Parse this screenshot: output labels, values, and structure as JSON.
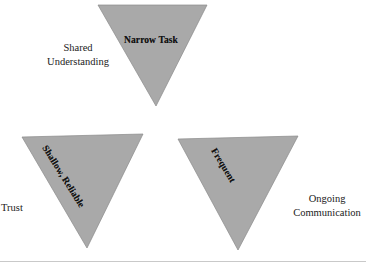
{
  "diagram": {
    "type": "triangles-diagram",
    "background_color": "#ffffff",
    "triangle_fill": "#a9a9a9",
    "triangle_stroke": "#8a8a8a",
    "triangles": [
      {
        "id": "narrow-task",
        "label": "Narrow Task",
        "points": "98,5 207,5 156,106",
        "rotation_deg": 0
      },
      {
        "id": "shallow-reliable",
        "label": "Shallow, Reliable",
        "points": "22,137 143,134 87,248",
        "rotation_deg": 58
      },
      {
        "id": "frequent",
        "label": "Frequent",
        "points": "178,139 298,136 238,250",
        "rotation_deg": 59
      }
    ],
    "outer_labels": [
      {
        "id": "shared-understanding",
        "line1": "Shared",
        "line2": "Understanding"
      },
      {
        "id": "trust",
        "line1": "Trust",
        "line2": ""
      },
      {
        "id": "ongoing-communication",
        "line1": "Ongoing",
        "line2": "Communication"
      }
    ]
  }
}
